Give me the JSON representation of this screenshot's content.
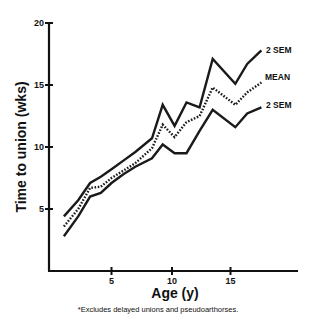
{
  "chart_data": {
    "type": "line",
    "title": "",
    "xlabel": "Age (y)",
    "ylabel": "Time to union (wks)",
    "xlim": [
      0,
      20.5
    ],
    "ylim": [
      0,
      20
    ],
    "x_ticks": [
      5,
      10,
      15
    ],
    "y_ticks": [
      5,
      10,
      15,
      20
    ],
    "grid": false,
    "legend": "inline labels at line ends",
    "x": [
      1,
      2.2,
      3.2,
      4.1,
      5,
      6,
      7,
      8.4,
      9.3,
      10.3,
      11.3,
      12.4,
      13.5,
      15.4,
      16.4,
      17.6
    ],
    "series": [
      {
        "name": "2 SEM",
        "position": "upper",
        "style": "solid",
        "values": [
          4.4,
          5.7,
          7.1,
          7.6,
          8.2,
          8.9,
          9.6,
          10.7,
          13.4,
          11.7,
          13.6,
          13.2,
          17.1,
          15.1,
          16.7,
          17.8
        ]
      },
      {
        "name": "MEAN",
        "position": "middle",
        "style": "dotted",
        "values": [
          3.6,
          5.0,
          6.7,
          6.8,
          7.5,
          8.1,
          8.7,
          9.9,
          11.8,
          10.8,
          12.0,
          12.5,
          14.8,
          13.4,
          14.4,
          15.2
        ]
      },
      {
        "name": "2 SEM",
        "position": "lower",
        "style": "solid",
        "values": [
          2.8,
          4.4,
          6.0,
          6.3,
          7.1,
          7.8,
          8.4,
          9.1,
          10.2,
          9.5,
          9.5,
          11.3,
          13.0,
          11.6,
          12.7,
          13.2
        ]
      }
    ],
    "footnote": "*Excludes delayed unions and pseudoarthorses."
  },
  "axes": {
    "x_title": "Age (y)",
    "y_title": "Time to union (wks)",
    "x_tick_labels": [
      "5",
      "10",
      "15"
    ],
    "y_tick_labels": [
      "5",
      "10",
      "15",
      "20"
    ]
  },
  "labels": {
    "upper": "2 SEM",
    "mean": "MEAN",
    "lower": "2 SEM"
  },
  "footnote": "*Excludes delayed unions and pseudoarthorses."
}
